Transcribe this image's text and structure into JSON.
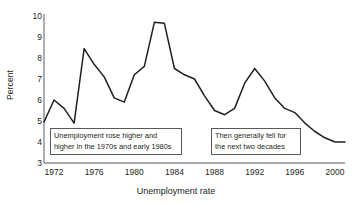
{
  "chart_data": {
    "type": "line",
    "title": "",
    "xlabel": "Unemployment rate",
    "ylabel": "Percent",
    "xlim": [
      1971,
      2001
    ],
    "ylim": [
      3,
      10
    ],
    "grid": false,
    "legend": false,
    "x": [
      1971,
      1972,
      1973,
      1974,
      1975,
      1976,
      1977,
      1978,
      1979,
      1980,
      1981,
      1982,
      1983,
      1984,
      1985,
      1986,
      1987,
      1988,
      1989,
      1990,
      1991,
      1992,
      1993,
      1994,
      1995,
      1996,
      1997,
      1998,
      1999,
      2000,
      2001
    ],
    "values": [
      4.95,
      6.0,
      5.6,
      4.9,
      8.45,
      7.7,
      7.1,
      6.1,
      5.9,
      7.2,
      7.6,
      9.7,
      9.65,
      7.5,
      7.2,
      7.0,
      6.2,
      5.5,
      5.3,
      5.6,
      6.8,
      7.5,
      6.9,
      6.1,
      5.6,
      5.4,
      4.9,
      4.5,
      4.2,
      4.0,
      4.0
    ],
    "series": [
      {
        "name": "Unemployment rate",
        "values": [
          4.95,
          6.0,
          5.6,
          4.9,
          8.45,
          7.7,
          7.1,
          6.1,
          5.9,
          7.2,
          7.6,
          9.7,
          9.65,
          7.5,
          7.2,
          7.0,
          6.2,
          5.5,
          5.3,
          5.6,
          6.8,
          7.5,
          6.9,
          6.1,
          5.6,
          5.4,
          4.9,
          4.5,
          4.2,
          4.0,
          4.0
        ]
      }
    ],
    "y_ticks": [
      3,
      4,
      5,
      6,
      7,
      8,
      9,
      10
    ],
    "x_ticks": [
      1972,
      1976,
      1980,
      1984,
      1988,
      1992,
      1996,
      2000
    ],
    "line_color": "#231f20",
    "axis_color": "#8a8c8e",
    "text_color": "#231f20"
  },
  "annotations": [
    {
      "name": "annotation-left",
      "line1": "Unemployment rose higher and",
      "line2": "higher in the 1970s and early 1980s"
    },
    {
      "name": "annotation-right",
      "line1": "Then generally fell for",
      "line2": "the next two decades"
    }
  ],
  "y_tick_labels": [
    "10",
    "9",
    "8",
    "7",
    "6",
    "5",
    "4",
    "3"
  ],
  "x_tick_labels": [
    "1972",
    "1976",
    "1980",
    "1984",
    "1988",
    "1992",
    "1996",
    "2000"
  ]
}
